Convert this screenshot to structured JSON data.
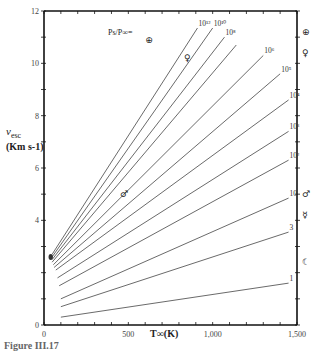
{
  "chart_data": {
    "type": "line",
    "title": "",
    "xlabel": "T∞(K)",
    "ylabel": "v_esc (Km s-1)",
    "xlim": [
      0,
      1500
    ],
    "ylim": [
      0,
      12
    ],
    "x_ticks": [
      0,
      500,
      1000,
      1500
    ],
    "x_tick_labels": [
      "0",
      "500",
      "1,000",
      "1,500"
    ],
    "y_ticks": [
      0,
      4,
      6,
      8,
      10,
      12
    ],
    "y_tick_labels": [
      "0",
      "4",
      "6",
      "8",
      "10",
      "12"
    ],
    "legend_title": "Ps/P∞=",
    "grid": false,
    "series": [
      {
        "name": "10^12",
        "label": "10¹²",
        "points": [
          [
            48,
            2.7
          ],
          [
            910,
            11.35
          ]
        ]
      },
      {
        "name": "10^10",
        "label": "10¹⁰",
        "points": [
          [
            48,
            2.6
          ],
          [
            1000,
            11.35
          ]
        ]
      },
      {
        "name": "10^8",
        "label": "10⁸",
        "points": [
          [
            48,
            2.5
          ],
          [
            1070,
            11.0
          ]
        ]
      },
      {
        "name": "10^7",
        "label": "",
        "points": [
          [
            48,
            2.4
          ],
          [
            1140,
            10.7
          ]
        ]
      },
      {
        "name": "10^6",
        "label": "10⁶",
        "points": [
          [
            55,
            2.3
          ],
          [
            1300,
            10.3
          ]
        ]
      },
      {
        "name": "10^5",
        "label": "10⁵",
        "points": [
          [
            60,
            2.2
          ],
          [
            1400,
            9.6
          ]
        ]
      },
      {
        "name": "10^4",
        "label": "10⁴",
        "points": [
          [
            70,
            2.1
          ],
          [
            1450,
            8.6
          ]
        ]
      },
      {
        "name": "10^3",
        "label": "10³",
        "points": [
          [
            80,
            1.8
          ],
          [
            1450,
            7.4
          ]
        ]
      },
      {
        "name": "10^2",
        "label": "10²",
        "points": [
          [
            90,
            1.5
          ],
          [
            1450,
            6.3
          ]
        ]
      },
      {
        "name": "10",
        "label": "10",
        "points": [
          [
            100,
            1.0
          ],
          [
            1450,
            4.85
          ]
        ]
      },
      {
        "name": "3",
        "label": "3",
        "points": [
          [
            100,
            0.7
          ],
          [
            1450,
            3.55
          ]
        ]
      },
      {
        "name": "1",
        "label": "1",
        "points": [
          [
            100,
            0.3
          ],
          [
            1450,
            1.6
          ]
        ]
      }
    ],
    "annotations": [
      {
        "symbol": "⊕",
        "name": "Earth",
        "x": 600,
        "v": 10.9
      },
      {
        "symbol": "♀",
        "name": "Venus",
        "x": 830,
        "v": 10.2
      },
      {
        "symbol": "♂",
        "name": "Mars",
        "x": 450,
        "v": 5.0
      },
      {
        "symbol": "⊕",
        "name": "Earth",
        "axis_v": 11.2
      },
      {
        "symbol": "♀",
        "name": "Venus",
        "axis_v": 10.4
      },
      {
        "symbol": "♂",
        "name": "Mars",
        "axis_v": 5.0
      },
      {
        "symbol": "☿",
        "name": "Mercury",
        "axis_v": 4.2
      },
      {
        "symbol": "☾",
        "name": "Moon",
        "axis_v": 2.4
      }
    ]
  },
  "labels": {
    "ylabel_v": "v",
    "ylabel_sub": "esc",
    "ylabel_units": "(Km s-1)",
    "xlabel": "T∞(K)",
    "ratio": "Ps/P∞=",
    "caption": "Figure III.17"
  }
}
